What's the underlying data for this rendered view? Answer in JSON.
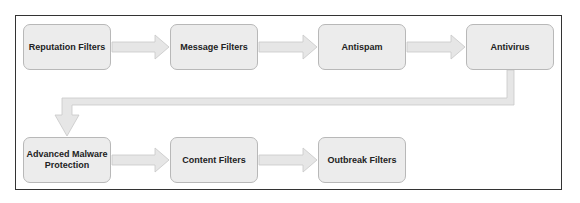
{
  "diagram": {
    "type": "flowchart",
    "colors": {
      "node_fill": "#ececec",
      "node_border": "#b8b8b8",
      "arrow_fill": "#e6e6e6",
      "arrow_border": "#c8c8c8",
      "frame": "#333333"
    },
    "nodes": [
      {
        "id": "reputation",
        "label": "Reputation Filters"
      },
      {
        "id": "message",
        "label": "Message Filters"
      },
      {
        "id": "antispam",
        "label": "Antispam"
      },
      {
        "id": "antivirus",
        "label": "Antivirus"
      },
      {
        "id": "amp",
        "label": "Advanced Malware Protection"
      },
      {
        "id": "content",
        "label": "Content Filters"
      },
      {
        "id": "outbreak",
        "label": "Outbreak Filters"
      }
    ],
    "edges": [
      {
        "from": "reputation",
        "to": "message"
      },
      {
        "from": "message",
        "to": "antispam"
      },
      {
        "from": "antispam",
        "to": "antivirus"
      },
      {
        "from": "antivirus",
        "to": "amp"
      },
      {
        "from": "amp",
        "to": "content"
      },
      {
        "from": "content",
        "to": "outbreak"
      }
    ]
  }
}
